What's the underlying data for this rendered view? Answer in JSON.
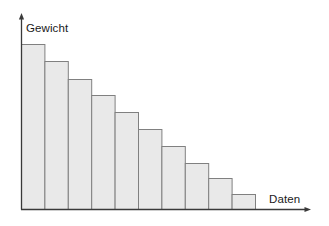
{
  "chart_data": {
    "type": "bar",
    "title": "",
    "subtitle": "",
    "xlabel": "Daten",
    "ylabel": "Gewicht",
    "categories": [
      "1",
      "2",
      "3",
      "4",
      "5",
      "6",
      "7",
      "8",
      "9",
      "10"
    ],
    "values": [
      165,
      148,
      130,
      114,
      97,
      80,
      63,
      46,
      31,
      15
    ],
    "ylim": [
      0,
      180
    ],
    "grid": false,
    "legend": null,
    "tick_labels_x": [],
    "tick_labels_y": [],
    "annotations": [],
    "style": {
      "bar_fill": "#e9e9e9",
      "bar_stroke": "#808080",
      "axis_color": "#3a3a3a",
      "background": "#ffffff"
    }
  },
  "figure": {
    "axes": {
      "y_axis_label": "Gewicht",
      "x_axis_label": "Daten",
      "y_arrow": "arrow-up",
      "x_arrow": "arrow-right"
    }
  }
}
